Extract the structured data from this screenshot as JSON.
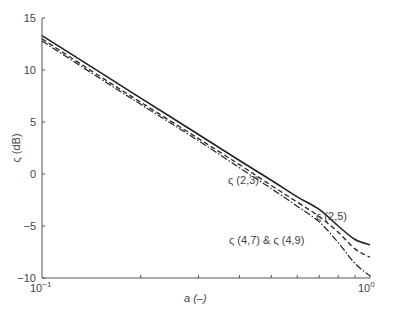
{
  "chart_data": {
    "type": "line",
    "title": "",
    "xlabel": "a (–)",
    "ylabel": "ς (dB)",
    "xscale": "log",
    "xlim": [
      0.1,
      1.0
    ],
    "ylim": [
      -10,
      15
    ],
    "xticks": [
      "10^-1",
      "10^0"
    ],
    "yticks": [
      -10,
      -5,
      0,
      5,
      10,
      15
    ],
    "grid": false,
    "series": [
      {
        "name": "ς (2,3)",
        "style": "solid",
        "x": [
          0.1,
          0.15,
          0.2,
          0.3,
          0.4,
          0.5,
          0.6,
          0.7,
          0.8,
          0.9,
          1.0
        ],
        "values": [
          13.3,
          9.8,
          7.3,
          3.8,
          1.3,
          -0.6,
          -2.2,
          -3.4,
          -5.0,
          -6.3,
          -6.8
        ]
      },
      {
        "name": "ς (2,5)",
        "style": "dashed",
        "x": [
          0.1,
          0.15,
          0.2,
          0.3,
          0.4,
          0.5,
          0.6,
          0.7,
          0.8,
          0.9,
          1.0
        ],
        "values": [
          13.0,
          9.4,
          6.9,
          3.4,
          0.9,
          -1.1,
          -2.7,
          -4.1,
          -5.6,
          -7.2,
          -8.0
        ]
      },
      {
        "name": "ς (4,7) & ς (4,9)",
        "style": "dashdot",
        "x": [
          0.1,
          0.15,
          0.2,
          0.3,
          0.4,
          0.5,
          0.6,
          0.7,
          0.8,
          0.9,
          1.0
        ],
        "values": [
          12.8,
          9.2,
          6.7,
          3.2,
          0.6,
          -1.4,
          -3.1,
          -4.6,
          -6.6,
          -8.6,
          -9.8
        ]
      }
    ],
    "annotations": [
      {
        "text": "ς (2,3)",
        "x": 0.62,
        "y": 1.9
      },
      {
        "text": "ς (2,5)",
        "x": 0.8,
        "y": -2.4
      },
      {
        "text": "ς (4,7) & ς (4,9)",
        "x": 0.42,
        "y": -6.5
      }
    ]
  },
  "labels": {
    "xlabel": "a (–)",
    "ylabel": "ς (dB)",
    "xtick0": "10",
    "xtick0_exp": "−1",
    "xtick1": "10",
    "xtick1_exp": "0",
    "ann1": "ς (2,3)",
    "ann2": "ς (2,5)",
    "ann3": "ς (4,7) & ς (4,9)"
  }
}
